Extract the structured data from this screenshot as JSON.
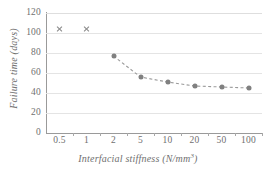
{
  "chart_data": {
    "type": "line",
    "title": "",
    "xlabel": "Interfacial stiffness (N/mm3)",
    "xlabel_base": "Interfacial stiffness (N/mm",
    "xlabel_exponent": "3",
    "xlabel_tail": ")",
    "ylabel": "Failure time (days)",
    "categories": [
      "0.5",
      "1",
      "2",
      "5",
      "10",
      "20",
      "50",
      "100"
    ],
    "ylim": [
      0,
      120
    ],
    "yticks": [
      "0",
      "20",
      "40",
      "60",
      "80",
      "100",
      "120"
    ],
    "grid": true,
    "legend": "none",
    "series": [
      {
        "name": "failure-time",
        "marker": "circle",
        "line": "dashed",
        "color": "#808080",
        "points": [
          {
            "category": "2",
            "value": 77
          },
          {
            "category": "5",
            "value": 56
          },
          {
            "category": "10",
            "value": 51
          },
          {
            "category": "20",
            "value": 47
          },
          {
            "category": "50",
            "value": 46
          },
          {
            "category": "100",
            "value": 45
          }
        ]
      },
      {
        "name": "no-failure",
        "marker": "x",
        "line": "none",
        "color": "#8a8a8a",
        "points": [
          {
            "category": "0.5",
            "value": 104
          },
          {
            "category": "1",
            "value": 104
          }
        ]
      }
    ]
  }
}
